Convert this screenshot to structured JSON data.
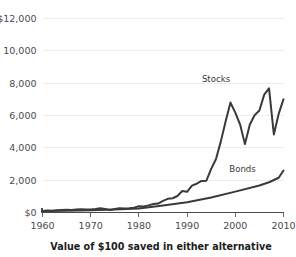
{
  "chart_data": {
    "type": "line",
    "title": "Value of $100 saved in either alternative",
    "xlabel": "",
    "ylabel": "",
    "xlim": [
      1960,
      2010
    ],
    "ylim": [
      0,
      12000
    ],
    "grid": true,
    "legend_position": "inline-annotation",
    "y_ticks": [
      {
        "value": 0,
        "label": "$0"
      },
      {
        "value": 2000,
        "label": "2,000"
      },
      {
        "value": 4000,
        "label": "4,000"
      },
      {
        "value": 6000,
        "label": "6,000"
      },
      {
        "value": 8000,
        "label": "8,000"
      },
      {
        "value": 10000,
        "label": "10,000"
      },
      {
        "value": 12000,
        "label": "$12,000"
      }
    ],
    "x_ticks": [
      {
        "value": 1960,
        "label": "1960"
      },
      {
        "value": 1970,
        "label": "1970"
      },
      {
        "value": 1980,
        "label": "1980"
      },
      {
        "value": 1990,
        "label": "1990"
      },
      {
        "value": 2000,
        "label": "2000"
      },
      {
        "value": 2010,
        "label": "2010"
      }
    ],
    "annotations": [
      {
        "name": "stocks-label",
        "text": "Stocks",
        "x": 1996.0,
        "y": 8050
      },
      {
        "name": "bonds-label",
        "text": "Bonds",
        "x": 2001.5,
        "y": 2500
      }
    ],
    "series": [
      {
        "name": "Stocks",
        "color": "#3a3a3a",
        "x": [
          1960,
          1961,
          1962,
          1963,
          1964,
          1965,
          1966,
          1967,
          1968,
          1969,
          1970,
          1971,
          1972,
          1973,
          1974,
          1975,
          1976,
          1977,
          1978,
          1979,
          1980,
          1981,
          1982,
          1983,
          1984,
          1985,
          1986,
          1987,
          1988,
          1989,
          1990,
          1991,
          1992,
          1993,
          1994,
          1995,
          1996,
          1997,
          1998,
          1999,
          2000,
          2001,
          2002,
          2003,
          2004,
          2005,
          2006,
          2007,
          2008,
          2009,
          2010
        ],
        "values": [
          100,
          120,
          112,
          135,
          155,
          168,
          152,
          186,
          205,
          188,
          192,
          218,
          256,
          220,
          160,
          214,
          262,
          245,
          258,
          300,
          390,
          370,
          440,
          530,
          555,
          720,
          845,
          880,
          1020,
          1330,
          1280,
          1660,
          1780,
          1950,
          1970,
          2700,
          3310,
          4400,
          5640,
          6800,
          6180,
          5440,
          4230,
          5430,
          6020,
          6310,
          7290,
          7680,
          4830,
          6100,
          7010
        ],
        "pixel_trace": "steep 1990s rise, 2000 dot-com peak near 9500, 2002 trough near 5900, 2007 peak near 10800, 2009 trough near 5900, recovery to 9800"
      },
      {
        "name": "Bonds",
        "color": "#3a3a3a",
        "x": [
          1960,
          1965,
          1970,
          1975,
          1980,
          1985,
          1990,
          1995,
          2000,
          2005,
          2007,
          2009,
          2010
        ],
        "values": [
          100,
          115,
          140,
          185,
          250,
          430,
          640,
          930,
          1290,
          1670,
          1870,
          2150,
          2600
        ]
      }
    ]
  }
}
